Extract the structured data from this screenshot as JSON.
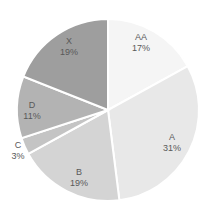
{
  "chart_data": {
    "type": "pie",
    "title": "",
    "start_angle_deg": 0,
    "direction": "clockwise",
    "categories": [
      "AA",
      "A",
      "B",
      "C",
      "D",
      "X"
    ],
    "values": [
      17,
      31,
      19,
      3,
      11,
      19
    ],
    "labels": [
      "17%",
      "31%",
      "19%",
      "3%",
      "11%",
      "19%"
    ],
    "colors": [
      "#f5f5f5",
      "#e8e8e8",
      "#d4d4d4",
      "#c4c4c4",
      "#b3b3b3",
      "#9e9e9e"
    ],
    "slice_border_color": "#ffffff",
    "legend": "none",
    "data_labels": "category and percentage"
  },
  "geometry": {
    "cx": 108,
    "cy": 110,
    "r": 91,
    "label_positions": [
      {
        "x": 141,
        "y": 40
      },
      {
        "x": 172,
        "y": 140
      },
      {
        "x": 79,
        "y": 175
      },
      {
        "x": 18,
        "y": 148
      },
      {
        "x": 32,
        "y": 108
      },
      {
        "x": 69,
        "y": 44
      }
    ]
  }
}
